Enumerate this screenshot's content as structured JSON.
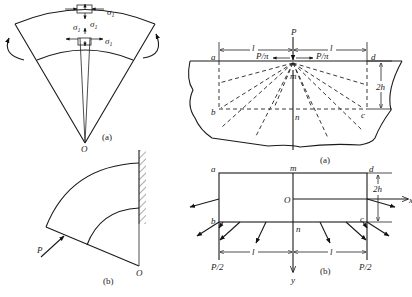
{
  "figures": {
    "left_top": {
      "caption": "(a)",
      "origin_label": "O",
      "stress_labels": [
        "σ1",
        "σ1",
        "σ1",
        "σ1"
      ],
      "stress_symbol": "σ",
      "stress_subscript": "1"
    },
    "left_bottom": {
      "caption": "(b)",
      "origin_label": "O",
      "force_label": "P"
    },
    "right_top": {
      "caption": "(a)",
      "force_label": "P",
      "half_force_left": "P/π",
      "half_force_right": "P/π",
      "corner_labels": {
        "a": "a",
        "b": "b",
        "c": "c",
        "d": "d"
      },
      "mid_labels": {
        "m": "m",
        "n": "n"
      },
      "length_left": "l",
      "length_right": "l",
      "height_label": "2h"
    },
    "right_bottom": {
      "caption": "(b)",
      "corner_labels": {
        "a": "a",
        "b": "b",
        "c": "c",
        "d": "d"
      },
      "mid_labels": {
        "m": "m",
        "n": "n"
      },
      "origin_label": "O",
      "axis_y": "y",
      "axis_x": "x",
      "length_left": "l",
      "length_right": "l",
      "height_label": "2h",
      "reaction_left": "P/2",
      "reaction_right": "P/2"
    }
  }
}
